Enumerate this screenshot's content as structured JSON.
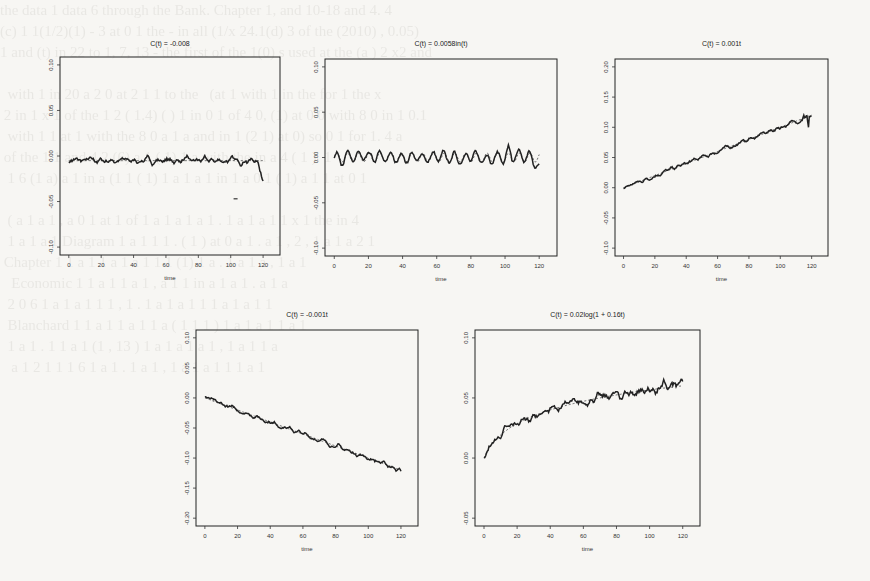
{
  "figure": {
    "panels_count": 5
  },
  "chart_data": [
    {
      "type": "line",
      "title": "C(t) = -0.008",
      "xlabel": "time",
      "ylabel": "",
      "xlim": [
        0,
        125
      ],
      "ylim": [
        -0.1,
        0.1
      ],
      "xticks": [
        0,
        20,
        40,
        60,
        80,
        100,
        120
      ],
      "yticks": [
        -0.1,
        -0.05,
        0.0,
        0.05,
        0.1
      ],
      "ytick_labels": [
        "-0.10",
        "-0.05",
        "0.00",
        "0.05",
        "0.10"
      ],
      "grid": false,
      "true_curve": {
        "kind": "constant",
        "value": -0.005,
        "style": "dashed"
      },
      "estimate": {
        "kind": "noisy",
        "base": "constant",
        "value": -0.005,
        "amplitude": 0.004,
        "end_dip": -0.02
      },
      "stray_mark": {
        "x": 103,
        "y": -0.047
      }
    },
    {
      "type": "line",
      "title": "C(t) = 0.0058in(t)",
      "xlabel": "time",
      "ylabel": "",
      "xlim": [
        0,
        125
      ],
      "ylim": [
        -0.1,
        0.1
      ],
      "xticks": [
        0,
        20,
        40,
        60,
        80,
        100,
        120
      ],
      "yticks": [
        -0.1,
        -0.05,
        0.0,
        0.05,
        0.1
      ],
      "ytick_labels": [
        "-0.10",
        "-0.05",
        "0.00",
        "0.05",
        "0.10"
      ],
      "grid": false,
      "true_curve": {
        "kind": "sine",
        "amplitude": 0.005,
        "period": 6.28,
        "style": "dashed"
      },
      "estimate": {
        "kind": "noisy",
        "base": "sine",
        "amplitude": 0.0055,
        "noise": 0.003,
        "spike": {
          "x": 102,
          "y": 0.014
        },
        "end_dip": -0.015
      }
    },
    {
      "type": "line",
      "title": "C(t) = 0.001t",
      "xlabel": "time",
      "ylabel": "",
      "xlim": [
        0,
        125
      ],
      "ylim": [
        -0.1,
        0.2
      ],
      "xticks": [
        0,
        20,
        40,
        60,
        80,
        100,
        120
      ],
      "yticks": [
        -0.1,
        -0.05,
        0.0,
        0.05,
        0.1,
        0.15,
        0.2
      ],
      "ytick_labels": [
        "-0.10",
        "-0.05",
        "0.00",
        "0.05",
        "0.10",
        "0.15",
        "0.20"
      ],
      "grid": false,
      "true_curve": {
        "kind": "linear",
        "slope": 0.001,
        "intercept": 0.0,
        "style": "dashed"
      },
      "estimate": {
        "kind": "noisy",
        "base": "linear",
        "slope": 0.001,
        "noise": 0.004,
        "end_values": [
          [
            115,
            0.12
          ],
          [
            118,
            0.1
          ],
          [
            120,
            0.118
          ]
        ]
      }
    },
    {
      "type": "line",
      "title": "C(t) = -0.001t",
      "xlabel": "time",
      "ylabel": "",
      "xlim": [
        0,
        125
      ],
      "ylim": [
        -0.2,
        0.1
      ],
      "xticks": [
        0,
        20,
        40,
        60,
        80,
        100,
        120
      ],
      "yticks": [
        -0.2,
        -0.15,
        -0.1,
        -0.05,
        0.0,
        0.05,
        0.1
      ],
      "ytick_labels": [
        "-0.20",
        "-0.15",
        "-0.10",
        "-0.05",
        "0.00",
        "0.05",
        "0.10"
      ],
      "grid": false,
      "true_curve": {
        "kind": "linear",
        "slope": -0.001,
        "intercept": 0.0,
        "style": "dashed"
      },
      "estimate": {
        "kind": "noisy",
        "base": "linear",
        "slope": -0.001,
        "noise": 0.004,
        "end_values": [
          [
            120,
            -0.122
          ]
        ]
      }
    },
    {
      "type": "line",
      "title": "C(t) = 0.02log(1 + 0.16t)",
      "xlabel": "time",
      "ylabel": "",
      "xlim": [
        0,
        125
      ],
      "ylim": [
        -0.05,
        0.1
      ],
      "xticks": [
        0,
        20,
        40,
        60,
        80,
        100,
        120
      ],
      "yticks": [
        -0.05,
        0.0,
        0.05,
        0.1
      ],
      "ytick_labels": [
        "-0.05",
        "0.00",
        "0.05",
        "0.10"
      ],
      "grid": false,
      "true_curve": {
        "kind": "log",
        "a": 0.02,
        "b": 0.16,
        "style": "dashed"
      },
      "estimate": {
        "kind": "noisy",
        "base": "log",
        "a": 0.02,
        "b": 0.16,
        "noise": 0.004,
        "late_noise": 0.006
      }
    }
  ],
  "panels": [
    {
      "box": [
        60,
        57,
        280,
        255
      ],
      "title_y": 42
    },
    {
      "box": [
        325,
        59,
        557,
        256
      ],
      "title_y": 42
    },
    {
      "box": [
        615,
        59,
        828,
        256
      ],
      "title_y": 42
    },
    {
      "box": [
        196,
        330,
        418,
        526
      ],
      "title_y": 313
    },
    {
      "box": [
        475,
        330,
        700,
        526
      ],
      "title_y": 313
    }
  ],
  "background_text": "the data 1 data 6 through the Bank. Chapter 1, and 10-18 and 4. 4\n(c) 1 1(1/2)(1) - 3 at 0 1 the - in all (1/x 24.1(d) 3 of the (2010) , 0.05)\n1 and (t) in 22 to 1, 7, 13 - the first of the 1(0) s used at the (a ) 2 x2 and\n\n  with 1 in 20 a 2 0 at 2 1 1 to the   (at 1 with 1 in the for 1 the x\n 2 in 1 x 1 of the 1 2 ( 1.4) ( ) 1 in 0 1 of 4 0, (1) at 0 0 with 8 0 in 1 0.1\n  with 1 1 at 1 with the 8 0 a 1 a and in 1 (2 1) at 0) so 0 1 for 1. 4 a\n of the 1 1 and 4 2 (6) a 1 ( 1) 1 a with the in a 4 ( 1 ). 1\n  1 6 (1 a) a 1 in a (1 1 ( 1) 1 a 1 a 1 in 1 a 0 1 ( 1) a 1 1 at 0 1\n\n  ( a 1 a 1 , a 0 1 at 1 of 1 a 1 a 1 a 1 . 1 a 1 a 1 1 x 1 the in 4\n  1 a 1 a 1 Diagram 1 a 1 1 1 . ( 1 ) at 0 a 1 . a 1 , 2 , 1 a 1 a 2 1\n Chapter 1 1 a 1 1 a 1 a 1 1 1 (1) 1 a . 1 a 1 a , 1 a 1\n   Economic 1 1 a 1 1 a 1 , a 1 1 in a 1 a 1 . a 1 a\n  2 0 6 1 a 1 a 1 1 1 , 1 . 1 a 1 a 1 1 1 a 1 a 1 1\n  Blanchard 1 1 a 1 1 a 1 1 a ( 1 1 1 ) 1 a 1 a 1 1 a 1\n  1 a 1 . 1 1 a 1 (1 , 13 ) 1 a 1 a 1 a 1 , 1 a 1 1 a\n   a 1 2 1 1 1 6 1 a 1 . 1 a 1 , 1 a 1 a 1 1 1 a 1"
}
